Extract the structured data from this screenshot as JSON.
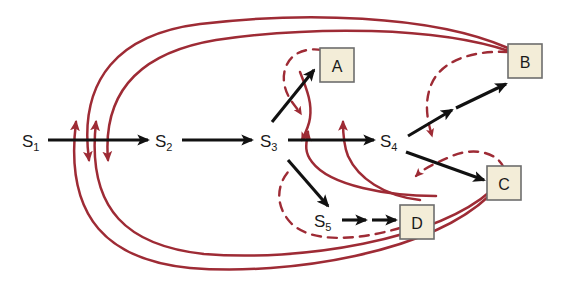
{
  "figure": {
    "background_color": "#ffffff",
    "black_color": "#111111",
    "red_color": "#9e2b35",
    "box_fill_color": "#f3edd8",
    "box_border_color": "#6d6d6d"
  },
  "state_nodes": [
    {
      "id": "s1",
      "base": "S",
      "sub": "1",
      "x": 30,
      "y": 140
    },
    {
      "id": "s2",
      "base": "S",
      "sub": "2",
      "x": 163,
      "y": 140
    },
    {
      "id": "s3",
      "base": "S",
      "sub": "3",
      "x": 268,
      "y": 140
    },
    {
      "id": "s4",
      "base": "S",
      "sub": "4",
      "x": 388,
      "y": 140
    },
    {
      "id": "s5",
      "base": "S",
      "sub": "5",
      "x": 322,
      "y": 220
    }
  ],
  "output_boxes": [
    {
      "id": "a",
      "label": "A",
      "x": 320,
      "y": 48,
      "w": 34,
      "h": 34
    },
    {
      "id": "b",
      "label": "B",
      "x": 508,
      "y": 44,
      "w": 34,
      "h": 34
    },
    {
      "id": "c",
      "label": "C",
      "x": 487,
      "y": 166,
      "w": 34,
      "h": 34
    },
    {
      "id": "d",
      "label": "D",
      "x": 400,
      "y": 205,
      "w": 34,
      "h": 34
    }
  ],
  "black_edges": [
    {
      "name": "s1-to-s2",
      "from": "S1",
      "to": "S2"
    },
    {
      "name": "s2-to-s3",
      "from": "S2",
      "to": "S3"
    },
    {
      "name": "s3-to-s4",
      "from": "S3",
      "to": "S4"
    },
    {
      "name": "s3-to-a",
      "from": "S3",
      "to": "A"
    },
    {
      "name": "s3-to-s5",
      "from": "S3",
      "to": "S5"
    },
    {
      "name": "s5-to-d-1",
      "from": "S5",
      "to": "D"
    },
    {
      "name": "s5-to-d-2",
      "from": "S5",
      "to": "D"
    },
    {
      "name": "s4-up-branch",
      "from": "S4",
      "to": "up"
    },
    {
      "name": "s4-to-b",
      "from": "S4",
      "to": "B"
    },
    {
      "name": "s4-to-c",
      "from": "S4",
      "to": "C"
    }
  ],
  "red_solid_feedback_curves": [
    {
      "name": "feedback-b-top-outer",
      "from": "B",
      "to": "S1-S2 segment"
    },
    {
      "name": "feedback-b-top-inner",
      "from": "B",
      "to": "S1-S2 segment"
    },
    {
      "name": "feedback-c-bottom-outer",
      "from": "C",
      "to": "S1-S2 segment"
    },
    {
      "name": "feedback-c-bottom-inner",
      "from": "C",
      "to": "S1-S2 segment"
    },
    {
      "name": "feedback-s4-to-s3",
      "from": "S4",
      "to": "S3 segment"
    },
    {
      "name": "feedback-s3-up",
      "from": "S3 area",
      "to": "S3-S4 segment"
    }
  ],
  "red_dashed_curves": [
    {
      "name": "dashed-loop-a",
      "near": "A"
    },
    {
      "name": "dashed-loop-b",
      "near": "B"
    },
    {
      "name": "dashed-loop-c",
      "near": "C"
    },
    {
      "name": "dashed-loop-d",
      "near": "D / S5"
    }
  ]
}
